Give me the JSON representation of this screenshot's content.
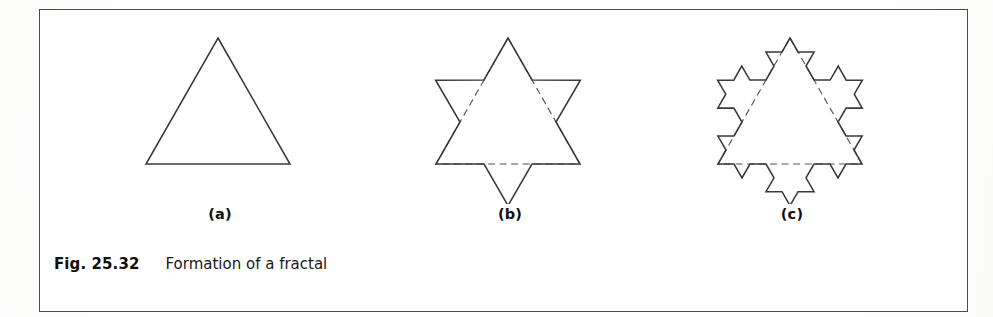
{
  "figure": {
    "caption_number": "Fig. 25.32",
    "caption_text": "Formation of a fractal",
    "border_color": "#4a4a4a",
    "background_color": "#ffffff",
    "stroke_color": "#3a3a3a",
    "guide_color": "#555555"
  },
  "panels": [
    {
      "id": "a",
      "label": "(a)",
      "shape": "koch-snowflake",
      "iteration": 0,
      "description": "equilateral triangle",
      "show_guide_triangle": false,
      "apex": [
        118,
        14
      ],
      "base_left": [
        46,
        140
      ],
      "base_right": [
        190,
        140
      ],
      "side_length": 144
    },
    {
      "id": "b",
      "label": "(b)",
      "shape": "koch-snowflake",
      "iteration": 1,
      "description": "Star of David / first Koch iteration",
      "show_guide_triangle": true,
      "apex": [
        118,
        14
      ],
      "base_left": [
        46,
        140
      ],
      "base_right": [
        190,
        140
      ],
      "side_length": 144
    },
    {
      "id": "c",
      "label": "(c)",
      "shape": "koch-snowflake",
      "iteration": 2,
      "description": "second Koch iteration",
      "show_guide_triangle": true,
      "apex": [
        118,
        14
      ],
      "base_left": [
        46,
        140
      ],
      "base_right": [
        190,
        140
      ],
      "side_length": 144
    }
  ]
}
